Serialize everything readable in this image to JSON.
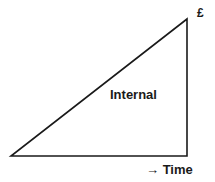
{
  "diagram": {
    "type": "right-triangle cost growth diagram",
    "stroke_color": "#1a1a1a",
    "background": "#ffffff",
    "vertices": {
      "origin": [
        11,
        156
      ],
      "bottom_right": [
        187,
        156
      ],
      "apex": [
        187,
        19
      ]
    },
    "labels": {
      "currency": "£",
      "region": "Internal",
      "x_axis_arrow": "→",
      "x_axis": "Time"
    }
  }
}
